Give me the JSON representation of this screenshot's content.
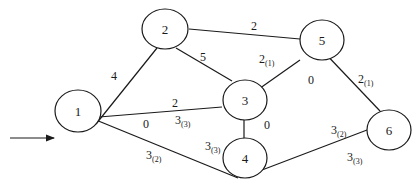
{
  "diagram": {
    "type": "weighted-network-graph",
    "entry_arrow": {
      "to": "1"
    },
    "nodes": [
      {
        "id": "1",
        "label": "1",
        "x": 78,
        "y": 138
      },
      {
        "id": "2",
        "label": "2",
        "x": 165,
        "y": 29
      },
      {
        "id": "3",
        "label": "3",
        "x": 245,
        "y": 100
      },
      {
        "id": "4",
        "label": "4",
        "x": 245,
        "y": 158
      },
      {
        "id": "5",
        "label": "5",
        "x": 322,
        "y": 41
      },
      {
        "id": "6",
        "label": "6",
        "x": 388,
        "y": 130
      }
    ],
    "edges": [
      {
        "from": "1",
        "to": "2",
        "labels": [
          {
            "text": "4",
            "sub": ""
          }
        ]
      },
      {
        "from": "2",
        "to": "5",
        "labels": [
          {
            "text": "2",
            "sub": ""
          }
        ]
      },
      {
        "from": "2",
        "to": "3",
        "labels": [
          {
            "text": "5",
            "sub": ""
          }
        ]
      },
      {
        "from": "3",
        "to": "5",
        "labels": [
          {
            "text": "2",
            "sub": "(1)"
          },
          {
            "text": "0",
            "sub": ""
          }
        ]
      },
      {
        "from": "5",
        "to": "6",
        "labels": [
          {
            "text": "2",
            "sub": "(1)"
          }
        ]
      },
      {
        "from": "1",
        "to": "3",
        "labels": [
          {
            "text": "2",
            "sub": ""
          },
          {
            "text": "3",
            "sub": "(3)"
          },
          {
            "text": "0",
            "sub": ""
          }
        ]
      },
      {
        "from": "3",
        "to": "4",
        "labels": [
          {
            "text": "0",
            "sub": ""
          },
          {
            "text": "3",
            "sub": "(3)"
          }
        ]
      },
      {
        "from": "1",
        "to": "4",
        "labels": [
          {
            "text": "3",
            "sub": "(2)"
          }
        ]
      },
      {
        "from": "4",
        "to": "6",
        "labels": [
          {
            "text": "3",
            "sub": "(2)"
          },
          {
            "text": "3",
            "sub": "(3)"
          }
        ]
      }
    ]
  },
  "labels": {
    "e12_w": "4",
    "e25_w": "2",
    "e23_w": "5",
    "e35_w": "2",
    "e35_s": "(1)",
    "e35_flow": "0",
    "e56_w": "2",
    "e56_s": "(1)",
    "e13_w": "2",
    "e13_f": "3",
    "e13_fs": "(3)",
    "e13_r": "0",
    "e34_w": "0",
    "e34_f": "3",
    "e34_fs": "(3)",
    "e14_w": "3",
    "e14_s": "(2)",
    "e46_w": "3",
    "e46_s": "(2)",
    "e46_f": "3",
    "e46_fs": "(3)",
    "n1": "1",
    "n2": "2",
    "n3": "3",
    "n4": "4",
    "n5": "5",
    "n6": "6"
  }
}
